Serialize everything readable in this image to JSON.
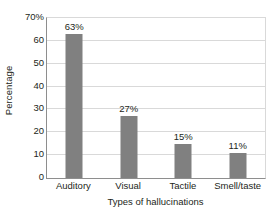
{
  "chart_data": {
    "type": "bar",
    "title": "",
    "categories": [
      "Auditory",
      "Visual",
      "Tactile",
      "Smell/taste"
    ],
    "values": [
      63,
      27,
      15,
      11
    ],
    "value_labels": [
      "63%",
      "27%",
      "15%",
      "11%"
    ],
    "xlabel": "Types of hallucinations",
    "ylabel": "Percentage",
    "ylim": [
      0,
      70
    ],
    "ytick_labels": [
      "0",
      "10",
      "20",
      "30",
      "40",
      "50",
      "60",
      "70%"
    ],
    "ytick_values": [
      0,
      10,
      20,
      30,
      40,
      50,
      60,
      70
    ],
    "grid": "horizontal",
    "legend": "none",
    "bar_color": "#808080",
    "gridline_color": "#d9d9d9",
    "axis_color": "#8e8e8e",
    "text_color": "#231f20",
    "background_color": "#ffffff"
  }
}
